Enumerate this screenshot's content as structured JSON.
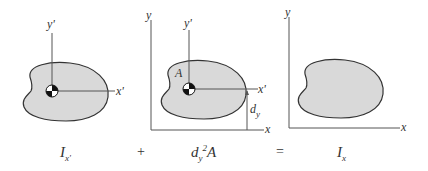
{
  "panels": [
    {
      "id": "centroidal",
      "axes": {
        "x_label": "x'",
        "y_label": "y'"
      },
      "centroid_marker": "centroid-icon",
      "caption": {
        "main": "I",
        "sub": "x'"
      }
    },
    {
      "id": "transfer",
      "axes": {
        "x_label": "x",
        "y_label": "y",
        "xp_label": "x'",
        "yp_label": "y'"
      },
      "area_label": "A",
      "distance_label": {
        "main": "d",
        "sub": "y"
      },
      "centroid_marker": "centroid-icon",
      "caption": {
        "d": "d",
        "sub": "y",
        "sup": "2",
        "A": "A"
      }
    },
    {
      "id": "result",
      "axes": {
        "x_label": "x",
        "y_label": "y"
      },
      "caption": {
        "main": "I",
        "sub": "x"
      }
    }
  ],
  "operators": {
    "plus": "+",
    "equals": "="
  },
  "colors": {
    "fill": "#d9d9d9",
    "stroke": "#333333",
    "axis": "#555555"
  }
}
